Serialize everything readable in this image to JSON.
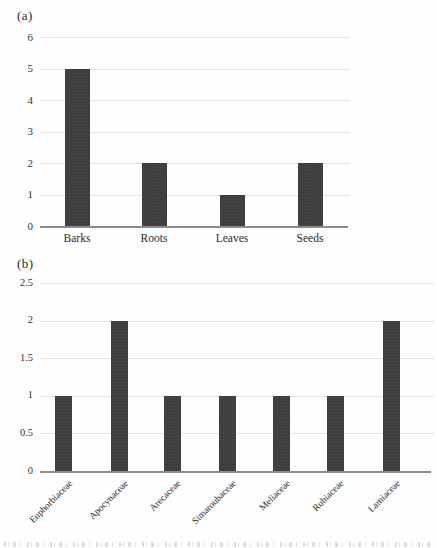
{
  "figure": {
    "panel_a_label": "(a)",
    "panel_b_label": "(b)"
  },
  "colors": {
    "bar": "#3e3e3e",
    "gridline": "#e4e4e4",
    "axis_line": "#8d8d8d",
    "text": "#2a2a2a"
  },
  "chart_data": [
    {
      "type": "bar",
      "panel_label": "(a)",
      "title": "",
      "xlabel": "",
      "ylabel": "",
      "categories": [
        "Barks",
        "Roots",
        "Leaves",
        "Seeds"
      ],
      "values": [
        5,
        2,
        1,
        2
      ],
      "ylim": [
        0,
        6
      ],
      "y_ticks": [
        "0",
        "1",
        "2",
        "3",
        "4",
        "5",
        "6"
      ],
      "grid": true,
      "legend": "none",
      "bar_color": "#3e3e3e",
      "x_tick_rotation": 0
    },
    {
      "type": "bar",
      "panel_label": "(b)",
      "title": "",
      "xlabel": "",
      "ylabel": "",
      "categories": [
        "Euphorbiaceae",
        "Apocynaceae",
        "Arecaceae",
        "Simaroubaceae",
        "Meliaceae",
        "Rubiaceae",
        "Lamiaceae"
      ],
      "values": [
        1,
        2,
        1,
        1,
        1,
        1,
        2
      ],
      "ylim": [
        0,
        2.5
      ],
      "y_ticks": [
        "0",
        "0.5",
        "1",
        "1.5",
        "2",
        "2.5"
      ],
      "grid": true,
      "legend": "none",
      "bar_color": "#3e3e3e",
      "x_tick_rotation": 45
    }
  ]
}
